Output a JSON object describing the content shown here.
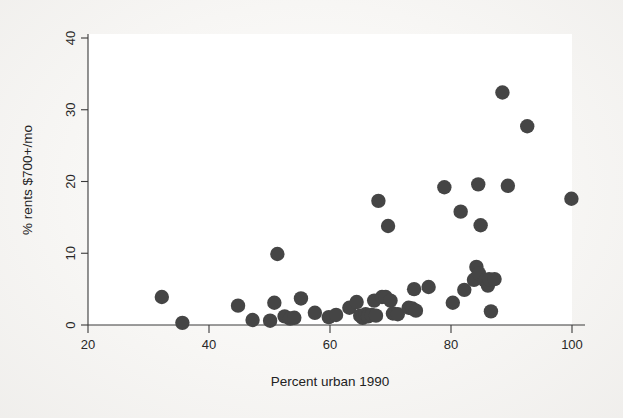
{
  "chart_data": {
    "type": "scatter",
    "title": "",
    "xlabel": "Percent urban 1990",
    "ylabel": "% rents $700+/mo",
    "xlim": [
      20,
      100
    ],
    "ylim": [
      0,
      40
    ],
    "xticks": [
      20,
      40,
      60,
      80,
      100
    ],
    "yticks": [
      0,
      10,
      20,
      30,
      40
    ],
    "xtick_labels": [
      "20",
      "40",
      "60",
      "80",
      "100"
    ],
    "ytick_labels": [
      "0",
      "10",
      "20",
      "30",
      "40"
    ],
    "grid": false,
    "legend": false,
    "marker": "filled-circle",
    "marker_color": "#454545",
    "marker_size": 7.2,
    "points": [
      {
        "x": 32.2,
        "y": 3.9
      },
      {
        "x": 35.6,
        "y": 0.3
      },
      {
        "x": 44.8,
        "y": 2.7
      },
      {
        "x": 47.2,
        "y": 0.7
      },
      {
        "x": 50.1,
        "y": 0.6
      },
      {
        "x": 50.8,
        "y": 3.1
      },
      {
        "x": 51.3,
        "y": 9.9
      },
      {
        "x": 52.5,
        "y": 1.2
      },
      {
        "x": 53.4,
        "y": 0.9
      },
      {
        "x": 54.1,
        "y": 1.0
      },
      {
        "x": 55.2,
        "y": 3.7
      },
      {
        "x": 57.5,
        "y": 1.7
      },
      {
        "x": 59.8,
        "y": 1.1
      },
      {
        "x": 61.0,
        "y": 1.4
      },
      {
        "x": 63.2,
        "y": 2.4
      },
      {
        "x": 64.4,
        "y": 3.2
      },
      {
        "x": 65.0,
        "y": 1.3
      },
      {
        "x": 65.4,
        "y": 1.0
      },
      {
        "x": 65.9,
        "y": 1.5
      },
      {
        "x": 66.3,
        "y": 1.2
      },
      {
        "x": 66.9,
        "y": 1.4
      },
      {
        "x": 67.3,
        "y": 3.4
      },
      {
        "x": 67.6,
        "y": 1.3
      },
      {
        "x": 68.0,
        "y": 17.3
      },
      {
        "x": 68.6,
        "y": 3.9
      },
      {
        "x": 69.2,
        "y": 3.9
      },
      {
        "x": 69.6,
        "y": 13.8
      },
      {
        "x": 70.0,
        "y": 3.4
      },
      {
        "x": 70.4,
        "y": 1.6
      },
      {
        "x": 71.2,
        "y": 1.5
      },
      {
        "x": 73.0,
        "y": 2.4
      },
      {
        "x": 73.6,
        "y": 2.3
      },
      {
        "x": 73.9,
        "y": 5.0
      },
      {
        "x": 74.2,
        "y": 2.0
      },
      {
        "x": 76.3,
        "y": 5.3
      },
      {
        "x": 78.9,
        "y": 19.2
      },
      {
        "x": 80.3,
        "y": 3.1
      },
      {
        "x": 81.6,
        "y": 15.8
      },
      {
        "x": 82.2,
        "y": 4.9
      },
      {
        "x": 83.8,
        "y": 6.3
      },
      {
        "x": 84.2,
        "y": 8.1
      },
      {
        "x": 84.5,
        "y": 19.6
      },
      {
        "x": 84.6,
        "y": 7.2
      },
      {
        "x": 84.9,
        "y": 13.9
      },
      {
        "x": 85.6,
        "y": 6.2
      },
      {
        "x": 86.1,
        "y": 5.5
      },
      {
        "x": 86.3,
        "y": 6.4
      },
      {
        "x": 86.6,
        "y": 1.9
      },
      {
        "x": 87.2,
        "y": 6.4
      },
      {
        "x": 88.5,
        "y": 32.4
      },
      {
        "x": 89.4,
        "y": 19.4
      },
      {
        "x": 92.6,
        "y": 27.7
      },
      {
        "x": 99.9,
        "y": 17.6
      }
    ]
  },
  "axes": {
    "x_title": "Percent urban 1990",
    "y_title": "% rents $700+/mo"
  }
}
